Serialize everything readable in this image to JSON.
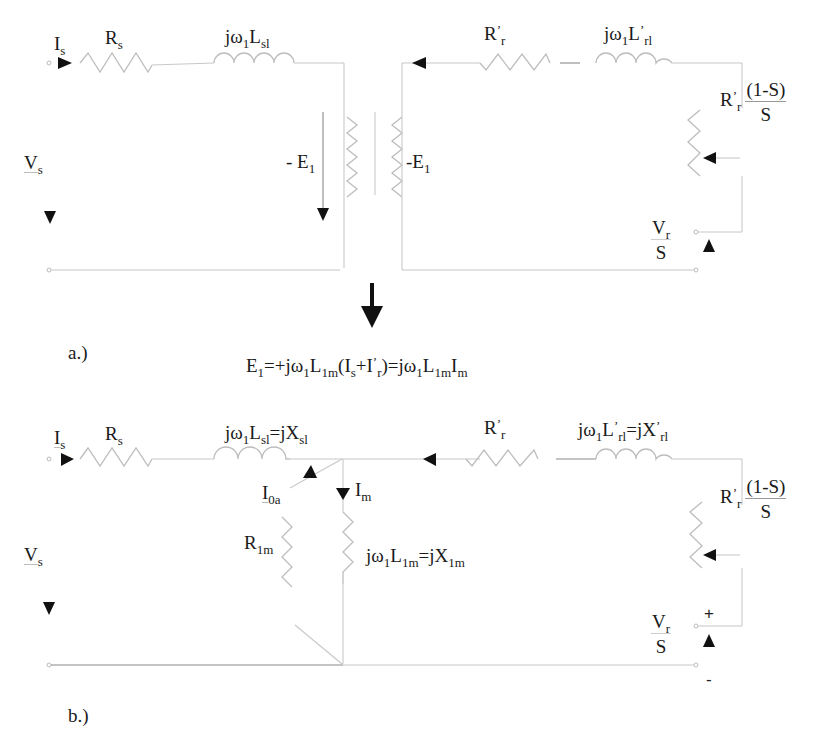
{
  "diagram_a": {
    "caption": "a.)",
    "labels": {
      "stator_current": {
        "main": "I",
        "sub": "s"
      },
      "stator_resistance": {
        "main": "R",
        "sub": "s"
      },
      "stator_leakage": {
        "pre": "jω",
        "sub1": "1",
        "main": "L",
        "sub2": "sl"
      },
      "stator_voltage": {
        "main": "V",
        "sub": "s"
      },
      "emf_left": {
        "main": "- E",
        "sub": "1"
      },
      "emf_right": {
        "main": "-E",
        "sub": "1"
      },
      "rotor_resistance": {
        "main": "R",
        "sup": "’",
        "sub": "r"
      },
      "rotor_leakage": {
        "pre": "jω",
        "sub1": "1",
        "main": "L",
        "sup": "’",
        "sub2": "rl"
      },
      "load_resistance": {
        "main": "R",
        "sup": "’",
        "sub": "r",
        "num": "(1-S)",
        "den": "S"
      },
      "rotor_voltage": {
        "num_main": "V",
        "num_sub": "r",
        "den": "S"
      }
    }
  },
  "transition": {
    "equation": {
      "p1": "E",
      "p1_sub": "1",
      "p2": "=+jω",
      "p2_sub": "1",
      "p3": "L",
      "p3_sub": "1m",
      "p4": "(I",
      "p4_sub": "s",
      "p5": "+I",
      "p5_sup": "’",
      "p5_sub": "r",
      "p6": ")=jω",
      "p6_sub": "1",
      "p7": "L",
      "p7_sub": "1m",
      "p8": "I",
      "p8_sub": "m"
    }
  },
  "diagram_b": {
    "caption": "b.)",
    "labels": {
      "stator_current": {
        "main": "I",
        "sub": "s"
      },
      "stator_resistance": {
        "main": "R",
        "sub": "s"
      },
      "stator_leakage": {
        "pre": "jω",
        "sub1": "1",
        "main": "L",
        "sub2": "sl",
        "eq": "=jX",
        "sub3": "sl"
      },
      "stator_voltage": {
        "main": "V",
        "sub": "s"
      },
      "core_loss_current": {
        "main": "I",
        "sub": "0a"
      },
      "magnetizing_current": {
        "main": "I",
        "sub": "m"
      },
      "core_loss_resistance": {
        "main": "R",
        "sub": "1m"
      },
      "magnetizing_reactance": {
        "pre": "jω",
        "sub1": "1",
        "main": "L",
        "sub2": "1m",
        "eq": "=jX",
        "sub3": "1m"
      },
      "rotor_resistance": {
        "main": "R",
        "sup": "’",
        "sub": "r"
      },
      "rotor_leakage": {
        "pre": "jω",
        "sub1": "1",
        "main": "L",
        "sup": "’",
        "sub2": "rl",
        "eq": "=jX",
        "sup2": "’",
        "sub3": "rl"
      },
      "load_resistance": {
        "main": "R",
        "sup": "’",
        "sub": "r",
        "num": "(1-S)",
        "den": "S"
      },
      "rotor_voltage": {
        "num_main": "V",
        "num_sub": "r",
        "den": "S"
      },
      "plus": "+",
      "minus": "-"
    }
  }
}
